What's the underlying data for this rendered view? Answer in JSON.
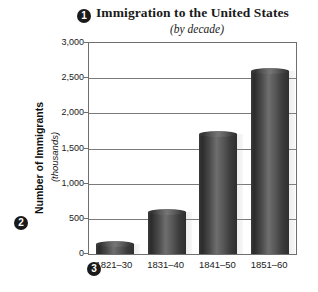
{
  "chart_data": {
    "type": "bar",
    "title": "Immigration to the United States",
    "subtitle": "(by decade)",
    "xlabel": "",
    "ylabel": "Number of Immigrants",
    "ylabel_units": "(thousands)",
    "categories": [
      "1821–30",
      "1831–40",
      "1841–50",
      "1851–60"
    ],
    "values": [
      143,
      599,
      1713,
      2598
    ],
    "ylim": [
      0,
      3000
    ],
    "ytick_labels": [
      "0",
      "500",
      "1,000",
      "1,500",
      "2,000",
      "2,500",
      "3,000"
    ],
    "ytick_values": [
      0,
      500,
      1000,
      1500,
      2000,
      2500,
      3000
    ],
    "grid": true,
    "legend": "none",
    "bar_color": "#4a4a4a",
    "bar_style": "3d-cylinder"
  },
  "callouts": [
    {
      "id": "1",
      "label": "1",
      "target": "chart-title"
    },
    {
      "id": "2",
      "label": "2",
      "target": "y-axis-title"
    },
    {
      "id": "3",
      "label": "3",
      "target": "x-axis-labels"
    }
  ]
}
